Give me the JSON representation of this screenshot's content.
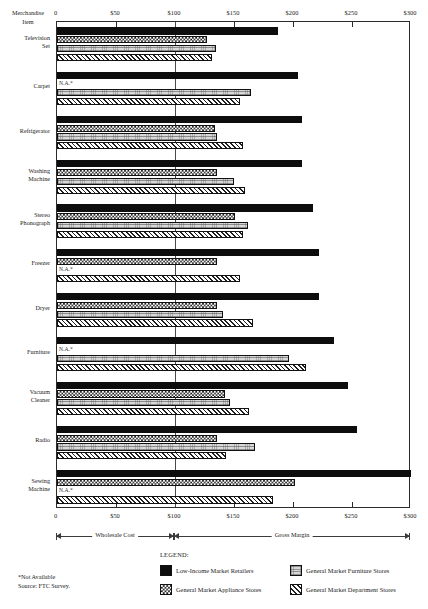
{
  "axis": {
    "corner_label_line1": "Merchandise",
    "corner_label_line2": "Item",
    "ticks": [
      "0",
      "$50",
      "$100",
      "$150",
      "$200",
      "$250",
      "$300"
    ],
    "tick_values": [
      0,
      50,
      100,
      150,
      200,
      250,
      300
    ]
  },
  "spans": {
    "wholesale": "Wholesale Cost",
    "margin": "Gross Margin"
  },
  "legend": {
    "title": "LEGEND:",
    "items": [
      {
        "key": "low",
        "label": "Low-Income Market Retailers"
      },
      {
        "key": "furn",
        "label": "General Market Furniture Stores"
      },
      {
        "key": "appl",
        "label": "General Market Appliance Stores"
      },
      {
        "key": "dept",
        "label": "General Market Department Stores"
      }
    ]
  },
  "footnotes": {
    "line1": "*Not Available",
    "line2": "Source: FTC Survey."
  },
  "na_marker": "N.A.*",
  "chart_data": {
    "type": "bar",
    "orientation": "horizontal",
    "title": "",
    "xlabel": "",
    "ylabel": "Merchandise Item",
    "xlim": [
      0,
      300
    ],
    "xticks": [
      0,
      50,
      100,
      150,
      200,
      250,
      300
    ],
    "xtick_labels": [
      "0",
      "$50",
      "$100",
      "$150",
      "$200",
      "$250",
      "$300"
    ],
    "grid": false,
    "reference_line": 100,
    "legend_position": "bottom",
    "categories": [
      "Television Set",
      "Carpet",
      "Refrigerator",
      "Washing Machine",
      "Stereo Phonograph",
      "Freezer",
      "Dryer",
      "Furniture",
      "Vacuum Cleaner",
      "Radio",
      "Sewing Machine"
    ],
    "category_lines": [
      [
        "Television",
        "Set"
      ],
      [
        "Carpet"
      ],
      [
        "Refrigerator"
      ],
      [
        "Washing",
        "Machine"
      ],
      [
        "Stereo",
        "Phonograph"
      ],
      [
        "Freezer"
      ],
      [
        "Dryer"
      ],
      [
        "Furniture"
      ],
      [
        "Vacuum",
        "Cleaner"
      ],
      [
        "Radio"
      ],
      [
        "Sewing",
        "Machine"
      ]
    ],
    "series": [
      {
        "name": "Low-Income Market Retailers",
        "key": "low",
        "values": [
          187,
          204,
          208,
          208,
          217,
          222,
          222,
          235,
          247,
          254,
          300
        ]
      },
      {
        "name": "General Market Appliance Stores",
        "key": "appl",
        "values": [
          127,
          null,
          134,
          136,
          151,
          136,
          136,
          null,
          142,
          136,
          202
        ]
      },
      {
        "name": "General Market Furniture Stores",
        "key": "furn",
        "values": [
          135,
          164,
          136,
          150,
          162,
          null,
          141,
          197,
          147,
          168,
          null
        ]
      },
      {
        "name": "General Market Department Stores",
        "key": "dept",
        "values": [
          131,
          155,
          158,
          159,
          158,
          155,
          166,
          211,
          163,
          143,
          183
        ]
      }
    ]
  }
}
